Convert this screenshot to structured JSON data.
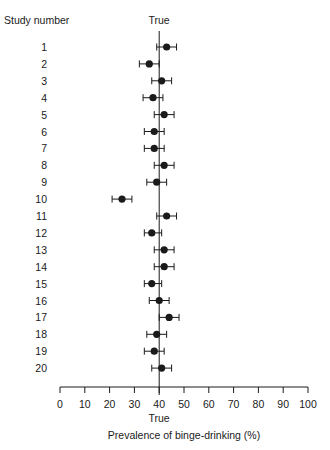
{
  "chart_data": {
    "type": "forest",
    "title": "",
    "row_header": "Study number",
    "reference_label_top": "True",
    "reference_label_bottom": "True",
    "reference_value": 40,
    "xlabel": "Prevalence of binge-drinking (%)",
    "ylabel": "Study number",
    "xlim": [
      0,
      100
    ],
    "xticks": [
      0,
      10,
      20,
      30,
      40,
      50,
      60,
      70,
      80,
      90,
      100
    ],
    "grid": false,
    "legend": null,
    "studies": [
      {
        "study": "1",
        "estimate": 43,
        "lower": 39,
        "upper": 47
      },
      {
        "study": "2",
        "estimate": 36,
        "lower": 32,
        "upper": 40
      },
      {
        "study": "3",
        "estimate": 41,
        "lower": 37,
        "upper": 45
      },
      {
        "study": "4",
        "estimate": 37.5,
        "lower": 33.5,
        "upper": 41.5
      },
      {
        "study": "5",
        "estimate": 42,
        "lower": 38,
        "upper": 46
      },
      {
        "study": "6",
        "estimate": 38,
        "lower": 34,
        "upper": 42
      },
      {
        "study": "7",
        "estimate": 38,
        "lower": 34,
        "upper": 42
      },
      {
        "study": "8",
        "estimate": 42,
        "lower": 38,
        "upper": 46
      },
      {
        "study": "9",
        "estimate": 39,
        "lower": 35,
        "upper": 43
      },
      {
        "study": "10",
        "estimate": 25,
        "lower": 21,
        "upper": 29
      },
      {
        "study": "11",
        "estimate": 43,
        "lower": 39,
        "upper": 47
      },
      {
        "study": "12",
        "estimate": 37,
        "lower": 34,
        "upper": 41
      },
      {
        "study": "13",
        "estimate": 42,
        "lower": 38,
        "upper": 46
      },
      {
        "study": "14",
        "estimate": 42,
        "lower": 38,
        "upper": 46
      },
      {
        "study": "15",
        "estimate": 37,
        "lower": 34,
        "upper": 41
      },
      {
        "study": "16",
        "estimate": 40,
        "lower": 36,
        "upper": 44
      },
      {
        "study": "17",
        "estimate": 44,
        "lower": 40,
        "upper": 48
      },
      {
        "study": "18",
        "estimate": 39,
        "lower": 35,
        "upper": 43
      },
      {
        "study": "19",
        "estimate": 38,
        "lower": 34,
        "upper": 42
      },
      {
        "study": "20",
        "estimate": 41,
        "lower": 37,
        "upper": 45
      }
    ]
  },
  "colors": {
    "ink": "#1a1a1a",
    "background": "#ffffff"
  }
}
